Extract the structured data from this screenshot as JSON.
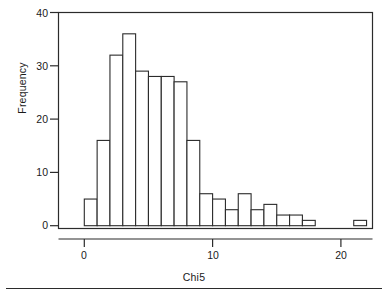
{
  "figure": {
    "background_color": "#ffffff",
    "line_color": "#2b2b2b",
    "bar_fill": "#ffffff",
    "footer_rule": true
  },
  "chart_data": {
    "type": "bar",
    "subtype": "histogram",
    "title": "",
    "xlabel": "Chi5",
    "ylabel": "Frequency",
    "xlim": [
      -1,
      22.5
    ],
    "ylim": [
      0,
      41
    ],
    "grid": false,
    "legend": null,
    "bin_width": 1,
    "xtick_labels": [
      "0",
      "10",
      "20"
    ],
    "xticks": [
      0,
      10,
      20
    ],
    "ytick_labels": [
      "0",
      "10",
      "20",
      "30",
      "40"
    ],
    "yticks": [
      0,
      10,
      20,
      30,
      40
    ],
    "bin_starts": [
      0,
      1,
      2,
      3,
      4,
      5,
      6,
      7,
      8,
      9,
      10,
      11,
      12,
      13,
      14,
      15,
      16,
      17,
      21
    ],
    "values": [
      5,
      16,
      32,
      36,
      29,
      28,
      28,
      27,
      16,
      6,
      5,
      3,
      6,
      3,
      4,
      2,
      2,
      1,
      1
    ],
    "bars": [
      {
        "bin_start": 0,
        "bin_end": 1,
        "value": 5
      },
      {
        "bin_start": 1,
        "bin_end": 2,
        "value": 16
      },
      {
        "bin_start": 2,
        "bin_end": 3,
        "value": 32
      },
      {
        "bin_start": 3,
        "bin_end": 4,
        "value": 36
      },
      {
        "bin_start": 4,
        "bin_end": 5,
        "value": 29
      },
      {
        "bin_start": 5,
        "bin_end": 6,
        "value": 28
      },
      {
        "bin_start": 6,
        "bin_end": 7,
        "value": 28
      },
      {
        "bin_start": 7,
        "bin_end": 8,
        "value": 27
      },
      {
        "bin_start": 8,
        "bin_end": 9,
        "value": 16
      },
      {
        "bin_start": 9,
        "bin_end": 10,
        "value": 6
      },
      {
        "bin_start": 10,
        "bin_end": 11,
        "value": 5
      },
      {
        "bin_start": 11,
        "bin_end": 12,
        "value": 3
      },
      {
        "bin_start": 12,
        "bin_end": 13,
        "value": 6
      },
      {
        "bin_start": 13,
        "bin_end": 14,
        "value": 3
      },
      {
        "bin_start": 14,
        "bin_end": 15,
        "value": 4
      },
      {
        "bin_start": 15,
        "bin_end": 16,
        "value": 2
      },
      {
        "bin_start": 16,
        "bin_end": 17,
        "value": 2
      },
      {
        "bin_start": 17,
        "bin_end": 18,
        "value": 1
      },
      {
        "bin_start": 21,
        "bin_end": 22,
        "value": 1
      }
    ]
  }
}
